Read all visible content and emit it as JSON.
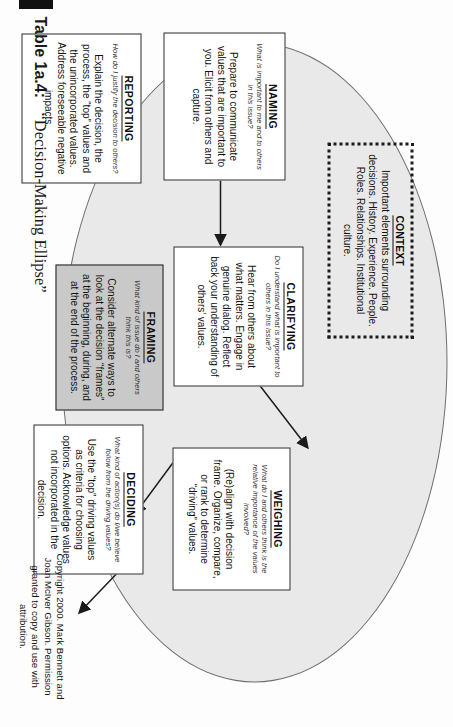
{
  "figure": {
    "table_label": "Table 1a.4:",
    "figure_title": "“Decision-Making Ellipse”"
  },
  "boxes": {
    "context": {
      "heading": "CONTEXT",
      "body": "Important elements surrounding decisions. History. Experience. People. Roles. Relationships. Institutional culture."
    },
    "naming": {
      "heading": "NAMING",
      "question": "What is important to me and to others in this issue?",
      "body": "Prepare to communicate values that are important to you. Elicit from others and capture."
    },
    "clarifying": {
      "heading": "CLARIFYING",
      "question": "Do I understand what is important to others in this issue?",
      "body": "Hear from others about what matters. Engage in genuine dialog. Reflect back your understanding of others’ values."
    },
    "weighing": {
      "heading": "WEIGHING",
      "question": "What do I and others think is the relative importance of the values involved?",
      "body": "(Re)align with decision frame. Organize, compare, or rank to determine “driving” values."
    },
    "framing": {
      "heading": "FRAMING",
      "question": "What kind of issue do I and others think this is?",
      "body": "Consider alternate ways to look at the decision “frames” at the beginning, during, and at the end of the process."
    },
    "deciding": {
      "heading": "DECIDING",
      "question": "What kind of action(s) do I/we believe follow from the driving values?",
      "body": "Use the “top” driving values as criteria for choosing options. Acknowledge values not incorporated in the decision."
    },
    "reporting": {
      "heading": "REPORTING",
      "question": "How do I justify the decision to others?",
      "body": "Explain the decision, the process, the “top” values and the unincorporated values. Address foreseeable negative impacts."
    }
  },
  "copyright": {
    "text": "Copyright 2000. Mark Bennett and Joan McIver Gibson. Permission granted to copy and use with attribution."
  },
  "colors": {
    "ellipse_fill": "#e9e9e9",
    "ellipse_stroke": "#6f6f6f",
    "framing_fill": "#c9c9c9",
    "box_stroke": "#2b2b2b",
    "text": "#111111"
  }
}
